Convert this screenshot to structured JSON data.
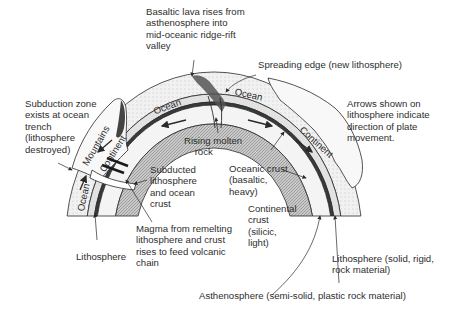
{
  "diagram": {
    "type": "plate-tectonics-cross-section",
    "layer_labels": {
      "ocean_left_top": "Ocean",
      "ocean_right_top": "Ocean",
      "ocean_left_side": "Ocean",
      "continent_left": "Continent",
      "mountains": "Mountains",
      "continent_right": "Continent"
    },
    "callouts": {
      "basaltic_lava": "Basaltic lava rises from\nasthenosphere into\nmid-oceanic ridge-rift\nvalley",
      "spreading_edge": "Spreading edge (new lithosphere)",
      "arrows_note": "Arrows shown on\nlithosphere indicate\ndirection of plate\nmovement.",
      "subduction_zone": "Subduction zone\nexists at ocean\ntrench\n(lithosphere\ndestroyed)",
      "rising_molten": "Rising molten\n    rock",
      "subducted": "Subducted\nlithosphere\nand ocean\ncrust",
      "oceanic_crust": "Oceanic crust\n(basaltic,\nheavy)",
      "continental_crust": "Continental\ncrust\n(silicic,\nlight)",
      "magma": "Magma from remelting\nlithosphere and crust\nrises to feed volcanic\nchain",
      "lithosphere_left": "Lithosphere",
      "lithosphere_right": "Lithosphere (solid, rigid,\nrock material)",
      "asthenosphere": "Asthenosphere (semi-solid, plastic rock material)"
    },
    "colors": {
      "line": "#2a2a2a",
      "asthenosphere_fill": "#b8b8b8",
      "ocean_fill": "#ececec",
      "lithosphere_fill": "#dcdcdc",
      "continent_fill": "#f7f7f7"
    }
  }
}
